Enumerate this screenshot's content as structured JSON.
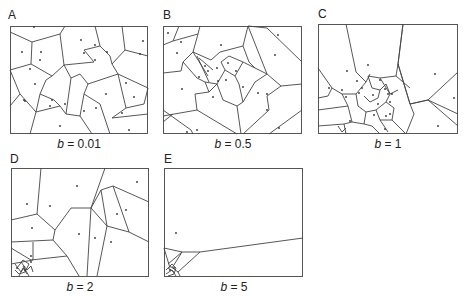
{
  "figure": {
    "type": "voronoi-panels",
    "panels": [
      {
        "id": "A",
        "letter": "A",
        "param_symbol": "b",
        "param_value": "0.01",
        "caption": "= 0.01",
        "box": {
          "x": 10,
          "y": 26,
          "w": 138,
          "h": 108
        }
      },
      {
        "id": "B",
        "letter": "B",
        "param_symbol": "b",
        "param_value": "0.5",
        "caption": "= 0.5",
        "box": {
          "x": 163,
          "y": 26,
          "w": 139,
          "h": 108
        }
      },
      {
        "id": "C",
        "letter": "C",
        "param_symbol": "b",
        "param_value": "1",
        "caption": "= 1",
        "box": {
          "x": 318,
          "y": 24,
          "w": 140,
          "h": 110
        }
      },
      {
        "id": "D",
        "letter": "D",
        "param_symbol": "b",
        "param_value": "2",
        "caption": "= 2",
        "box": {
          "x": 11,
          "y": 168,
          "w": 138,
          "h": 109
        }
      },
      {
        "id": "E",
        "letter": "E",
        "param_symbol": "b",
        "param_value": "5",
        "caption": "= 5",
        "box": {
          "x": 164,
          "y": 168,
          "w": 139,
          "h": 109
        }
      }
    ]
  }
}
